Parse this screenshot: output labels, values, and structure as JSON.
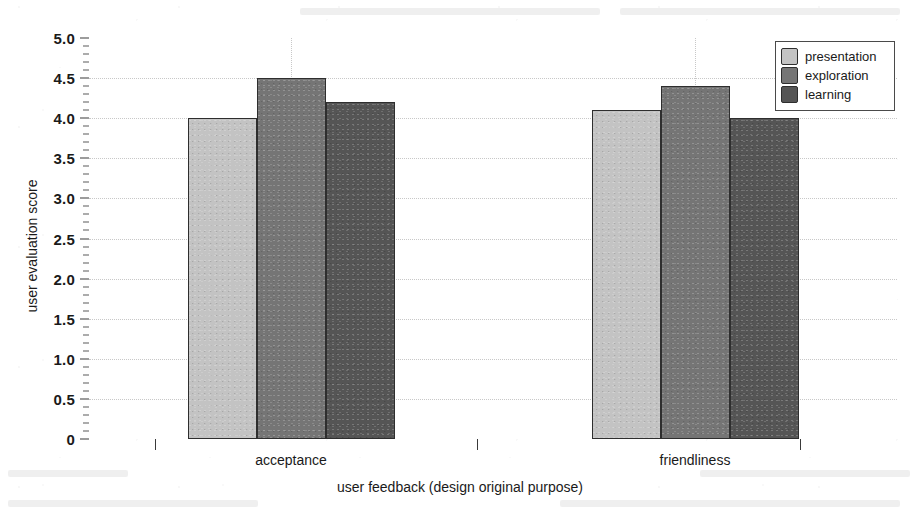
{
  "chart_data": {
    "type": "bar",
    "title": "",
    "xlabel": "user feedback (design original purpose)",
    "ylabel": "user evaluation score",
    "categories": [
      "acceptance",
      "friendliness"
    ],
    "series": [
      {
        "name": "presentation",
        "values": [
          4.0,
          4.1
        ],
        "color": "#c3c3c3"
      },
      {
        "name": "exploration",
        "values": [
          4.5,
          4.4
        ],
        "color": "#757575"
      },
      {
        "name": "learning",
        "values": [
          4.2,
          4.0
        ],
        "color": "#555555"
      }
    ],
    "ylim": [
      0,
      5.0
    ],
    "ytick_labels": [
      "0",
      "0.5",
      "1.0",
      "1.5",
      "2.0",
      "2.5",
      "3.0",
      "3.5",
      "4.0",
      "4.5",
      "5.0"
    ],
    "ytick_values": [
      0,
      0.5,
      1.0,
      1.5,
      2.0,
      2.5,
      3.0,
      3.5,
      4.0,
      4.5,
      5.0
    ],
    "grid": true,
    "grid_style": "dotted",
    "legend_position": "top-right",
    "legend_entries": [
      "presentation",
      "exploration",
      "learning"
    ]
  },
  "axes": {
    "y_title": "user evaluation score",
    "x_title": "user feedback (design original purpose)"
  },
  "colors": {
    "presentation": "#c3c3c3",
    "exploration": "#757575",
    "learning": "#555555",
    "axis": "#3a3a3a",
    "grid": "#c8c8c8",
    "background": "#ffffff"
  }
}
